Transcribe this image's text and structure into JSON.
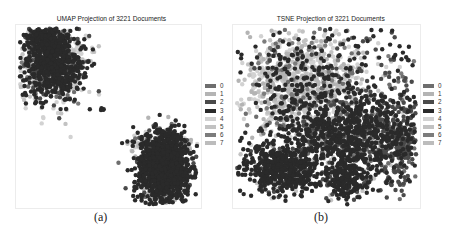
{
  "figure": {
    "panels": [
      {
        "id": "a",
        "title": "UMAP Projection of 3221 Documents",
        "caption": "(a)"
      },
      {
        "id": "b",
        "title": "TSNE Projection of 3221 Documents",
        "caption": "(b)"
      }
    ],
    "legend": {
      "items": [
        {
          "label": "0",
          "color": "#6e6e6e"
        },
        {
          "label": "1",
          "color": "#b4b4b4"
        },
        {
          "label": "2",
          "color": "#4a4a4a"
        },
        {
          "label": "3",
          "color": "#2a2a2a"
        },
        {
          "label": "4",
          "color": "#d2d2d2"
        },
        {
          "label": "5",
          "color": "#c2c2c2"
        },
        {
          "label": "6",
          "color": "#7c7c7c"
        },
        {
          "label": "7",
          "color": "#bcbcbc"
        }
      ]
    }
  },
  "chart_data": [
    {
      "type": "scatter",
      "title": "UMAP Projection of 3221 Documents",
      "caption": "(a)",
      "n_points": 3221,
      "xlabel": "",
      "ylabel": "",
      "axes_visible": false,
      "grid": false,
      "legend_position": "right",
      "legend_entries": [
        "0",
        "1",
        "2",
        "3",
        "4",
        "5",
        "6",
        "7"
      ],
      "clusters": [
        {
          "description": "upper-left cluster, dark (label 3/2) top and right, light (label 4/5) lower-left",
          "center": [
            0.2,
            0.22
          ],
          "spread": [
            0.08,
            0.1
          ],
          "n": 1150,
          "mix": {
            "3": 0.45,
            "2": 0.15,
            "4": 0.2,
            "5": 0.12,
            "0": 0.05,
            "6": 0.03
          }
        },
        {
          "description": "upper-left cluster top lobe",
          "center": [
            0.17,
            0.08
          ],
          "spread": [
            0.05,
            0.04
          ],
          "n": 220,
          "mix": {
            "3": 0.8,
            "2": 0.2
          }
        },
        {
          "description": "tiny isolated group near center",
          "center": [
            0.47,
            0.46
          ],
          "spread": [
            0.005,
            0.008
          ],
          "n": 4,
          "mix": {
            "3": 1.0
          }
        },
        {
          "description": "lower-right cluster, mostly dark (label 3), light fringe on top",
          "center": [
            0.8,
            0.78
          ],
          "spread": [
            0.07,
            0.09
          ],
          "n": 1500,
          "mix": {
            "3": 0.72,
            "2": 0.12,
            "4": 0.08,
            "1": 0.05,
            "0": 0.03
          }
        },
        {
          "description": "lower-right cluster light top fringe",
          "center": [
            0.8,
            0.65
          ],
          "spread": [
            0.08,
            0.025
          ],
          "n": 240,
          "mix": {
            "4": 0.45,
            "5": 0.3,
            "1": 0.15,
            "3": 0.1
          }
        }
      ],
      "xlim": [
        0,
        1
      ],
      "ylim": [
        0,
        1
      ]
    },
    {
      "type": "scatter",
      "title": "TSNE Projection of 3221 Documents",
      "caption": "(b)",
      "n_points": 3221,
      "xlabel": "",
      "ylabel": "",
      "axes_visible": false,
      "grid": false,
      "legend_position": "right",
      "legend_entries": [
        "0",
        "1",
        "2",
        "3",
        "4",
        "5",
        "6",
        "7"
      ],
      "clusters": [
        {
          "description": "large light region upper-left (labels 4/5/1)",
          "center": [
            0.35,
            0.32
          ],
          "spread": [
            0.16,
            0.14
          ],
          "n": 900,
          "mix": {
            "4": 0.35,
            "5": 0.25,
            "1": 0.15,
            "3": 0.15,
            "6": 0.05,
            "0": 0.05
          }
        },
        {
          "description": "dense dark mass lower-left",
          "center": [
            0.25,
            0.78
          ],
          "spread": [
            0.1,
            0.07
          ],
          "n": 520,
          "mix": {
            "3": 0.8,
            "2": 0.1,
            "5": 0.05,
            "4": 0.05
          }
        },
        {
          "description": "dark band across center-right",
          "center": [
            0.6,
            0.6
          ],
          "spread": [
            0.18,
            0.1
          ],
          "n": 900,
          "mix": {
            "3": 0.65,
            "2": 0.2,
            "5": 0.08,
            "0": 0.07
          }
        },
        {
          "description": "right arm, medium-dark (label 2/0)",
          "center": [
            0.88,
            0.62
          ],
          "spread": [
            0.06,
            0.16
          ],
          "n": 300,
          "mix": {
            "2": 0.55,
            "0": 0.25,
            "3": 0.2
          }
        },
        {
          "description": "lower center dark tail",
          "center": [
            0.6,
            0.85
          ],
          "spread": [
            0.06,
            0.06
          ],
          "n": 250,
          "mix": {
            "3": 0.7,
            "5": 0.15,
            "2": 0.15
          }
        },
        {
          "description": "scattered outliers top and edges",
          "center": [
            0.55,
            0.25
          ],
          "spread": [
            0.3,
            0.2
          ],
          "n": 351,
          "mix": {
            "3": 0.5,
            "2": 0.2,
            "4": 0.15,
            "6": 0.1,
            "0": 0.05
          }
        }
      ],
      "xlim": [
        0,
        1
      ],
      "ylim": [
        0,
        1
      ]
    }
  ]
}
